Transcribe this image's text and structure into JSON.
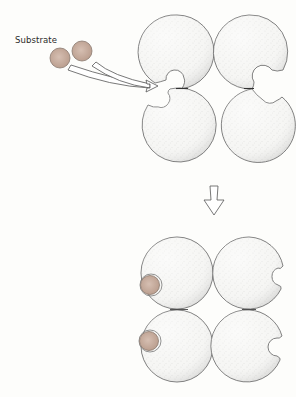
{
  "diagram": {
    "type": "allosteric-enzyme-substrate-binding",
    "labels": {
      "substrate": "Substrate"
    },
    "colors": {
      "background": "#fdfdfb",
      "subunit_stroke": "#6f6f6f",
      "subunit_fill": "#f4f4f2",
      "stipple": "#a8a8a8",
      "substrate_fill": "#c9aea0",
      "substrate_stroke": "#8a7a70",
      "arrow_stroke": "#555555"
    },
    "free_substrates": [
      {
        "cx": 60,
        "cy": 58,
        "r": 10
      },
      {
        "cx": 82,
        "cy": 51,
        "r": 10
      }
    ],
    "stage_1": {
      "description": "Tetramer with open binding sites; substrate approaching",
      "subunits": [
        {
          "position": "top-left",
          "cx": 177,
          "cy": 52,
          "r": 37
        },
        {
          "position": "top-right",
          "cx": 249,
          "cy": 52,
          "r": 37
        },
        {
          "position": "bottom-left",
          "cx": 177,
          "cy": 125,
          "r": 37
        },
        {
          "position": "bottom-right",
          "cx": 249,
          "cy": 125,
          "r": 37
        }
      ]
    },
    "transition_arrow": {
      "direction": "down",
      "x": 214,
      "y_top": 186,
      "y_bottom": 215
    },
    "stage_2": {
      "description": "Tetramer with substrate bound to left subunits; right subunits open",
      "subunits": [
        {
          "position": "top-left",
          "cx": 177,
          "cy": 273,
          "r": 36
        },
        {
          "position": "top-right",
          "cx": 249,
          "cy": 273,
          "r": 36
        },
        {
          "position": "bottom-left",
          "cx": 177,
          "cy": 346,
          "r": 36
        },
        {
          "position": "bottom-right",
          "cx": 249,
          "cy": 346,
          "r": 36
        }
      ],
      "bound_substrates": [
        {
          "cx": 150,
          "cy": 285,
          "r": 10
        },
        {
          "cx": 149,
          "cy": 341,
          "r": 10
        }
      ]
    }
  }
}
